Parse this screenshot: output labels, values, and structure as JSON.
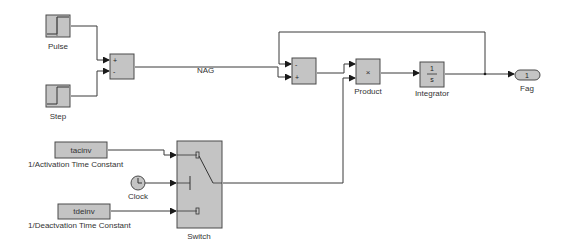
{
  "diagram": {
    "type": "simulink-block-diagram",
    "colors": {
      "block_fill": "#c4c4c4",
      "block_stroke": "#4a4a4a",
      "wire": "#3a3a3a",
      "background": "#ffffff"
    },
    "blocks": {
      "pulse": {
        "label": "Pulse",
        "icon": "pulse-generator-icon"
      },
      "step": {
        "label": "Step",
        "icon": "step-icon"
      },
      "sum1": {
        "signs": [
          "+",
          "-"
        ],
        "icon": "sum-icon"
      },
      "sum2": {
        "signs": [
          "-",
          "+"
        ],
        "icon": "sum-icon"
      },
      "product": {
        "label": "Product",
        "symbol": "×",
        "icon": "product-icon"
      },
      "integrator": {
        "label": "Integrator",
        "numerator": "1",
        "denominator": "s",
        "icon": "integrator-icon"
      },
      "outport": {
        "label": "Fag",
        "port_number": "1",
        "icon": "outport-icon"
      },
      "tacinv": {
        "value": "tacinv",
        "label": "1/Activation Time Constant",
        "icon": "constant-icon"
      },
      "clock": {
        "label": "Clock",
        "icon": "clock-icon"
      },
      "tdeinv": {
        "value": "tdeinv",
        "label": "1/Deactvation Time Constant",
        "icon": "constant-icon"
      },
      "switch": {
        "label": "Switch",
        "icon": "switch-icon"
      }
    },
    "signals": {
      "nag": "NAG"
    }
  }
}
